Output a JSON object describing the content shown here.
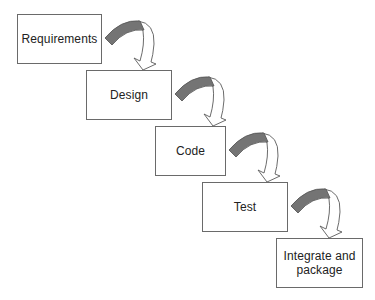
{
  "diagram": {
    "type": "waterfall-process",
    "colors": {
      "box_border": "#6a6a6a",
      "arrow_fill": "#747474",
      "arrow_outline": "#5a5a5a",
      "arrow_head_fill": "#ffffff",
      "text": "#222222",
      "background": "#ffffff"
    },
    "stages": [
      {
        "id": "requirements",
        "label": "Requirements",
        "x": 17,
        "y": 14,
        "w": 85,
        "h": 50
      },
      {
        "id": "design",
        "label": "Design",
        "x": 86,
        "y": 70,
        "w": 86,
        "h": 50
      },
      {
        "id": "code",
        "label": "Code",
        "x": 155,
        "y": 126,
        "w": 71,
        "h": 50
      },
      {
        "id": "test",
        "label": "Test",
        "x": 202,
        "y": 182,
        "w": 86,
        "h": 50
      },
      {
        "id": "integrate-and-package",
        "label": "Integrate and\npackage",
        "x": 276,
        "y": 238,
        "w": 87,
        "h": 50
      }
    ],
    "connections": [
      {
        "from": "requirements",
        "to": "design"
      },
      {
        "from": "design",
        "to": "code"
      },
      {
        "from": "code",
        "to": "test"
      },
      {
        "from": "test",
        "to": "integrate-and-package"
      }
    ]
  }
}
